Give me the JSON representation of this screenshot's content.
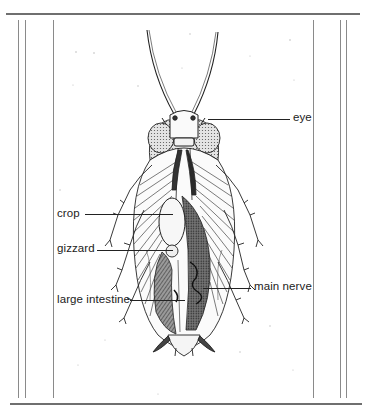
{
  "diagram": {
    "labels": {
      "eye": "eye",
      "crop": "crop",
      "gizzard": "gizzard",
      "main_nerve": "main nerve",
      "large_intestine": "large intestine"
    }
  },
  "colors": {
    "ink": "#222222",
    "frame": "#6f6f6f",
    "shade_dark": "#3a3a3a",
    "shade_mid": "#8a8a8a",
    "shade_light": "#cfcfcf",
    "background": "#ffffff"
  }
}
